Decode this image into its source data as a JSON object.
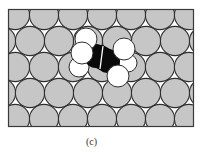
{
  "figure": {
    "caption": "(c)",
    "colors": {
      "surface_atom_fill": "#c6c6c6",
      "surface_atom_stroke": "#2e2e2e",
      "background_gap": "#ffffff",
      "frame_stroke": "#3a3a3a",
      "hydrogen_fill": "#ffffff",
      "hydrogen_stroke": "#2e2e2e",
      "carbon_fill": "#0a0a0a",
      "bond_line": "#ffffff"
    },
    "frame": {
      "x": 8,
      "y": 9,
      "width": 186,
      "height": 118
    },
    "surface": {
      "atom_radius": 14.6,
      "spacing_x": 29,
      "row_centers_y": [
        15,
        41,
        67,
        93,
        119
      ],
      "row_start_x": [
        15,
        1,
        15,
        1,
        15
      ],
      "atoms_per_row": 7
    },
    "molecule": {
      "carbons": [
        {
          "label": "C1",
          "cx": 96,
          "cy": 56,
          "r": 10
        },
        {
          "label": "C2",
          "cx": 108,
          "cy": 61,
          "r": 10
        }
      ],
      "hydrogens": [
        {
          "label": "H1",
          "cx": 86,
          "cy": 39,
          "r": 11
        },
        {
          "label": "H2",
          "cx": 82,
          "cy": 53,
          "r": 11
        },
        {
          "label": "H3",
          "cx": 79,
          "cy": 67,
          "r": 10
        },
        {
          "label": "H4",
          "cx": 128,
          "cy": 63,
          "r": 9
        },
        {
          "label": "H5",
          "cx": 124,
          "cy": 49,
          "r": 11
        },
        {
          "label": "H6",
          "cx": 118,
          "cy": 76,
          "r": 11
        }
      ],
      "bond": {
        "x1": 103,
        "y1": 46,
        "x2": 100,
        "y2": 69
      }
    }
  }
}
